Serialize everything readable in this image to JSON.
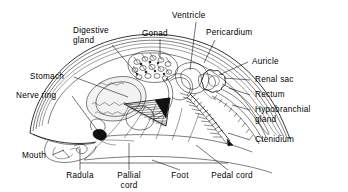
{
  "figure": {
    "style": "black and white line drawing",
    "width": 348,
    "height": 192,
    "background_color": "#ffffff",
    "line_color": "#000000"
  },
  "labels": {
    "digestive_gland": "Digestive\ngland",
    "digestive_gland_line1": "Digestive",
    "digestive_gland_line2": "gland",
    "gonad": "Gonad",
    "ventricle": "Ventricle",
    "pericardium": "Pericardium",
    "auricle": "Auricle",
    "renal_sac": "Renal  sac",
    "rectum": "Rectum",
    "hypobranchial_gland_line1": "Hypobranchial",
    "hypobranchial_gland_line2": "gland",
    "ctenidium": "Ctenidium",
    "stomach": "Stomach",
    "nerve_ring": "Nerve  ring",
    "mouth": "Mouth",
    "radula": "Radula",
    "pallial_cord_line1": "Pallial",
    "pallial_cord_line2": "cord",
    "foot": "Foot",
    "pedal_cord": "Pedal  cord"
  },
  "parts": [
    {
      "id": "digestive-gland",
      "label": "Digestive gland",
      "label_position": "top-left"
    },
    {
      "id": "gonad",
      "label": "Gonad",
      "label_position": "top-center"
    },
    {
      "id": "ventricle",
      "label": "Ventricle",
      "label_position": "top-center"
    },
    {
      "id": "pericardium",
      "label": "Pericardium",
      "label_position": "top-right"
    },
    {
      "id": "auricle",
      "label": "Auricle",
      "label_position": "right"
    },
    {
      "id": "renal-sac",
      "label": "Renal  sac",
      "label_position": "right"
    },
    {
      "id": "rectum",
      "label": "Rectum",
      "label_position": "right"
    },
    {
      "id": "hypobranchial-gland",
      "label": "Hypobranchial gland",
      "label_position": "right"
    },
    {
      "id": "ctenidium",
      "label": "Ctenidium",
      "label_position": "right"
    },
    {
      "id": "stomach",
      "label": "Stomach",
      "label_position": "left"
    },
    {
      "id": "nerve-ring",
      "label": "Nerve  ring",
      "label_position": "left"
    },
    {
      "id": "mouth",
      "label": "Mouth",
      "label_position": "bottom-left"
    },
    {
      "id": "radula",
      "label": "Radula",
      "label_position": "bottom"
    },
    {
      "id": "pallial-cord",
      "label": "Pallial cord",
      "label_position": "bottom"
    },
    {
      "id": "foot",
      "label": "Foot",
      "label_position": "bottom"
    },
    {
      "id": "pedal-cord",
      "label": "Pedal  cord",
      "label_position": "bottom-right"
    }
  ]
}
